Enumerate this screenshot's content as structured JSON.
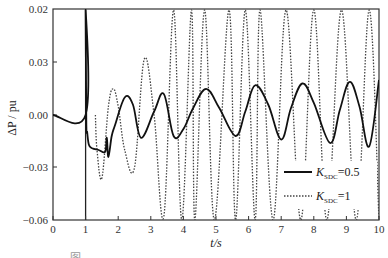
{
  "chart_data": {
    "type": "line",
    "title": "",
    "xlabel": "t/s",
    "ylabel": "ΔP / pu",
    "xlim": [
      0,
      10
    ],
    "ylim": [
      -0.06,
      0.06
    ],
    "grid": false,
    "legend_position": "lower right",
    "x_ticks": [
      "0",
      "1",
      "2",
      "3",
      "4",
      "5",
      "6",
      "7",
      "8",
      "9",
      "10"
    ],
    "y_ticks": [
      "0.02",
      "0.03",
      "0.00",
      "−0.03",
      "−0.06"
    ],
    "series": [
      {
        "name": "K_SDC=0.5",
        "style": "solid",
        "x": [
          0,
          1.0,
          1.0,
          1.02,
          1.05,
          1.1,
          1.2,
          1.4,
          1.6,
          1.65,
          1.7,
          1.8,
          1.9,
          2.2,
          2.45,
          2.7,
          3.1,
          3.4,
          3.7,
          4.0,
          4.3,
          4.7,
          5.1,
          5.6,
          5.9,
          6.2,
          6.6,
          7.0,
          7.3,
          7.65,
          8.0,
          8.5,
          8.8,
          9.1,
          9.4,
          9.7,
          10.0
        ],
        "values": [
          0.0,
          0.0,
          0.06,
          -0.003,
          -0.01,
          -0.017,
          -0.019,
          -0.02,
          -0.021,
          -0.013,
          -0.024,
          -0.012,
          -0.006,
          0.01,
          0.006,
          -0.013,
          0.002,
          0.012,
          -0.012,
          -0.008,
          0.004,
          0.015,
          0.004,
          -0.012,
          0.002,
          0.017,
          0.006,
          -0.014,
          0.004,
          0.018,
          0.007,
          -0.016,
          0.003,
          0.019,
          0.005,
          -0.018,
          0.02
        ]
      },
      {
        "name": "K_SDC=1",
        "style": "dotted",
        "x": [
          1.3,
          1.35,
          1.5,
          1.7,
          1.85,
          2.0,
          2.2,
          2.5,
          2.8,
          3.1,
          3.4,
          3.7,
          3.95,
          4.25,
          4.35,
          4.65,
          4.95,
          5.4,
          5.6,
          5.9,
          6.2,
          6.35,
          6.75,
          7.15,
          7.6,
          8.0,
          8.4,
          8.85,
          9.3,
          9.7,
          10.0
        ],
        "values": [
          0.0,
          -0.02,
          -0.036,
          0.005,
          0.015,
          0.005,
          -0.02,
          -0.03,
          0.032,
          0.0,
          -0.058,
          0.06,
          -0.06,
          0.06,
          -0.06,
          0.06,
          -0.06,
          0.06,
          -0.06,
          0.06,
          -0.06,
          0.06,
          -0.06,
          0.06,
          -0.06,
          0.06,
          -0.06,
          0.06,
          -0.06,
          0.06,
          -0.06
        ]
      }
    ],
    "legend": [
      {
        "label_main": "K",
        "label_sub": "SDC",
        "label_rest": "=0.5",
        "style": "solid"
      },
      {
        "label_main": "K",
        "label_sub": "SDC",
        "label_rest": "=1",
        "style": "dotted"
      }
    ]
  },
  "caption": "图 ...  ...  ...  ..."
}
